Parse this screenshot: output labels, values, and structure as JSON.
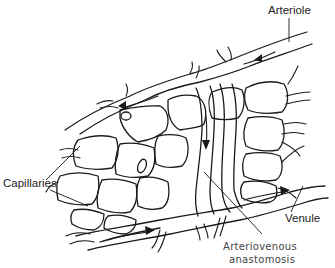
{
  "diagram": {
    "labels": {
      "arteriole": "Arteriole",
      "capillaries": "Capillaries",
      "venule": "Venule",
      "av_line1": "Arteriovenous",
      "av_line2": "anastomosis"
    },
    "flow_arrows": [
      {
        "vessel": "arteriole",
        "direction": "left-down"
      },
      {
        "vessel": "arteriole-branch",
        "direction": "left"
      },
      {
        "vessel": "arteriovenous-anastomosis",
        "direction": "down"
      },
      {
        "vessel": "venule",
        "direction": "right"
      },
      {
        "vessel": "venule-lower",
        "direction": "right"
      }
    ],
    "colors": {
      "line": "#1a1a1a",
      "background": "#ffffff",
      "text": "#222222"
    }
  }
}
